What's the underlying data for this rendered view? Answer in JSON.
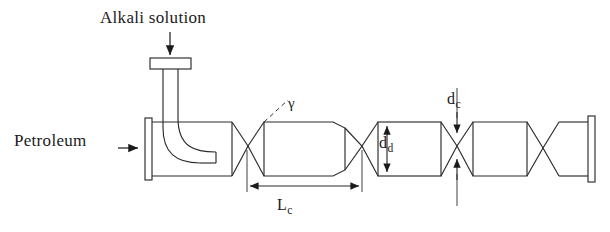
{
  "figure": {
    "type": "process-equipment-schematic",
    "background_color": "#ffffff",
    "line_color": "#2b2b2b"
  },
  "labels": {
    "alkali_inlet": "Alkali solution",
    "petroleum_inlet": "Petroleum",
    "convergence_angle": "γ",
    "chamber_length": {
      "base": "L",
      "sub": "c"
    },
    "chamber_diameter": {
      "base": "d",
      "sub": "d"
    },
    "throat_diameter": {
      "base": "d",
      "sub": "c"
    }
  },
  "annotations": [
    {
      "name": "alkali-inlet-arrow",
      "direction": "down",
      "points_to": "injector-cap-flange"
    },
    {
      "name": "petroleum-inlet-arrow",
      "direction": "right",
      "points_to": "inlet-flange"
    },
    {
      "name": "gamma-leader",
      "style": "dashed",
      "points_to": "converging-cone-wall"
    },
    {
      "name": "lc-dimension",
      "style": "double-headed-arrow",
      "orientation": "horizontal"
    },
    {
      "name": "dd-dimension",
      "style": "double-headed-arrow",
      "orientation": "vertical"
    },
    {
      "name": "dc-dimension",
      "style": "inward-arrows",
      "orientation": "vertical"
    }
  ],
  "components": [
    {
      "name": "alkali-injector-cap",
      "shape": "rectangular-flange"
    },
    {
      "name": "alkali-downcomer-tube",
      "shape": "vertical-tube"
    },
    {
      "name": "alkali-elbow-nozzle",
      "shape": "curved-elbow"
    },
    {
      "name": "inlet-flange-plate",
      "shape": "vertical-plate"
    },
    {
      "name": "inlet-chamber",
      "shape": "rectangle"
    },
    {
      "name": "venturi-throat-1",
      "shape": "hourglass"
    },
    {
      "name": "mixing-chamber-1",
      "shape": "tapered-cylinder"
    },
    {
      "name": "venturi-throat-2",
      "shape": "hourglass"
    },
    {
      "name": "mixing-chamber-2",
      "shape": "rectangle"
    },
    {
      "name": "venturi-throat-3",
      "shape": "hourglass"
    },
    {
      "name": "mixing-chamber-3",
      "shape": "tapered-cylinder"
    },
    {
      "name": "venturi-throat-4",
      "shape": "hourglass"
    },
    {
      "name": "outlet-chamber",
      "shape": "rectangle"
    },
    {
      "name": "outlet-flange-plate",
      "shape": "vertical-plate"
    }
  ]
}
